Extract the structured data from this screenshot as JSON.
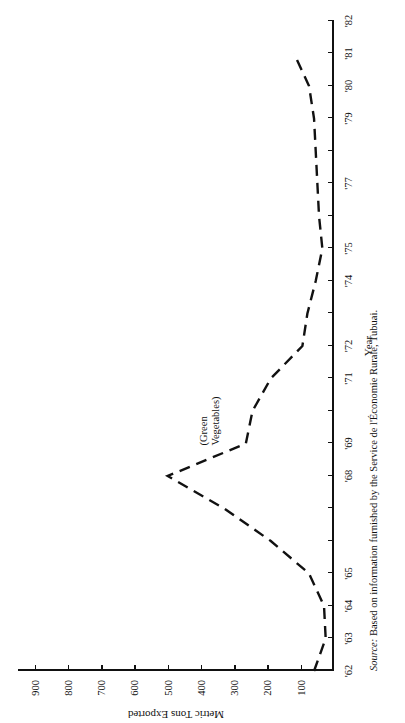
{
  "figure": {
    "source_prefix": "Source:",
    "source_text": " Based on information furnished by the Service de l'Économie Rurale, Tubuai.",
    "series_label_line1": "(Green",
    "series_label_line2": "Vegetables)"
  },
  "chart_data": {
    "type": "line",
    "title": "",
    "xlabel": "Year",
    "ylabel": "Metric Tons Exported",
    "xlim": [
      1962,
      1982
    ],
    "ylim": [
      0,
      950
    ],
    "grid": false,
    "legend": "none",
    "line_style": "dashed",
    "line_color": "#111111",
    "orientation": "page rotated 90 degrees (sideways figure)",
    "annotations": [
      {
        "text": "(Green Vegetables)",
        "x": 1969,
        "y": 330
      }
    ],
    "x_tick_labels": [
      "'62",
      "'63",
      "'64",
      "'65",
      "",
      "",
      "'68",
      "'69",
      "",
      "'71",
      "'72",
      "",
      "'74",
      "'75",
      "",
      "'77",
      "",
      "'79",
      "'80",
      "'81",
      "'82"
    ],
    "x_tick_values": [
      1962,
      1963,
      1964,
      1965,
      1966,
      1967,
      1968,
      1969,
      1970,
      1971,
      1972,
      1973,
      1974,
      1975,
      1976,
      1977,
      1978,
      1979,
      1980,
      1981,
      1982
    ],
    "y_tick_labels": [
      "100",
      "200",
      "300",
      "400",
      "500",
      "600",
      "700",
      "800",
      "900"
    ],
    "y_tick_values": [
      100,
      200,
      300,
      400,
      500,
      600,
      700,
      800,
      900
    ],
    "series": [
      {
        "name": "Green Vegetables",
        "x": [
          1962,
          1963,
          1964,
          1965,
          1966,
          1967,
          1968,
          1969,
          1970,
          1971,
          1972,
          1973,
          1974,
          1975,
          1976,
          1977,
          1978,
          1979,
          1980,
          1981
        ],
        "values": [
          60,
          25,
          30,
          75,
          190,
          330,
          500,
          265,
          245,
          190,
          95,
          80,
          55,
          35,
          45,
          50,
          55,
          60,
          75,
          120
        ]
      }
    ]
  }
}
